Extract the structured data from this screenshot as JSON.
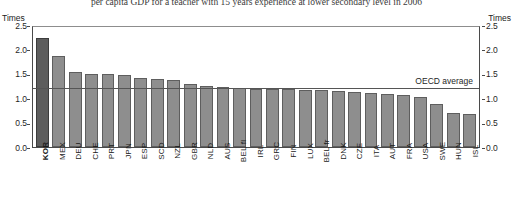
{
  "figure": {
    "title": "per capita GDP for a teacher with 15 years experience at lower secondary level in 2006",
    "unit_left": "Times",
    "unit_right": "Times"
  },
  "annotations": {
    "oecd_average_label": "OECD average",
    "oecd_average_value": 1.25
  },
  "colors": {
    "bar": "#8e8e8e",
    "bar_highlight": "#5d5d5d",
    "bar_border": "#5e5e5e",
    "axis": "#4a4a4a",
    "reference_line": "#555555"
  },
  "chart_data": {
    "type": "bar",
    "title": "per capita GDP for a teacher with 15 years experience at lower secondary level in 2006",
    "xlabel": "",
    "ylabel": "Times",
    "ylim": [
      0.0,
      2.5
    ],
    "yticks": [
      "0.0",
      "0.5",
      "1.0",
      "1.5",
      "2.0",
      "2.5"
    ],
    "ytick_values": [
      0.0,
      0.5,
      1.0,
      1.5,
      2.0,
      2.5
    ],
    "grid": false,
    "legend": "none",
    "highlight_category": "KOR",
    "categories": [
      "KOR",
      "MEX",
      "DEU",
      "CHE",
      "PRT",
      "JPN",
      "ESP",
      "SCD",
      "NZL",
      "GBR",
      "NLD",
      "AUS",
      "BEL fl",
      "IRL",
      "GRC",
      "FIN",
      "LUX",
      "BEL fr",
      "DNK",
      "CZE",
      "ITA",
      "AUT",
      "FRA",
      "USA",
      "SWE",
      "HUN",
      "ISL"
    ],
    "values": [
      2.27,
      1.9,
      1.56,
      1.53,
      1.52,
      1.5,
      1.44,
      1.41,
      1.39,
      1.31,
      1.28,
      1.26,
      1.22,
      1.21,
      1.2,
      1.2,
      1.19,
      1.18,
      1.17,
      1.15,
      1.12,
      1.1,
      1.08,
      1.05,
      0.9,
      0.7,
      0.68
    ],
    "annotations": [
      {
        "type": "hline",
        "label": "OECD average",
        "value": 1.25
      }
    ]
  }
}
